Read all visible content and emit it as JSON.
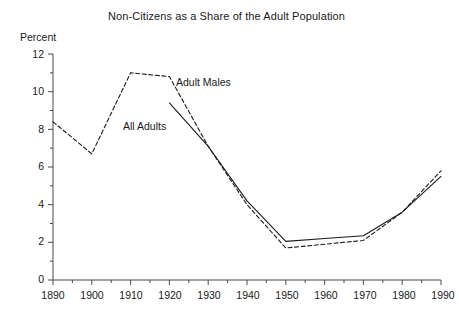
{
  "chart_data": {
    "type": "line",
    "title": "Non-Citizens as a Share of the Adult Population",
    "ylabel": "Percent",
    "xlabel": "",
    "xlim": [
      1890,
      1990
    ],
    "ylim": [
      0,
      12
    ],
    "grid": false,
    "legend_position": "inline-annotation",
    "x": [
      1890,
      1900,
      1910,
      1920,
      1930,
      1940,
      1950,
      1960,
      1970,
      1980,
      1990
    ],
    "xticks": [
      "1890",
      "1900",
      "1910",
      "1920",
      "1930",
      "1940",
      "1950",
      "1960",
      "1970",
      "1980",
      "1990"
    ],
    "yticks": [
      "0",
      "2",
      "4",
      "6",
      "8",
      "10",
      "12"
    ],
    "ytick_values": [
      0,
      2,
      4,
      6,
      8,
      10,
      12
    ],
    "minor_ytick_values": [
      1,
      3,
      5,
      7,
      9,
      11
    ],
    "series": [
      {
        "name": "Adult Males",
        "style": "dashed",
        "color": "#1a1a1a",
        "x": [
          1890,
          1900,
          1910,
          1920,
          1930,
          1940,
          1950,
          1960,
          1970,
          1980,
          1990
        ],
        "values": [
          8.4,
          6.7,
          11.0,
          10.8,
          7.1,
          4.0,
          1.7,
          1.9,
          2.1,
          3.6,
          5.8
        ]
      },
      {
        "name": "All Adults",
        "style": "solid",
        "color": "#1a1a1a",
        "x": [
          1920,
          1930,
          1940,
          1950,
          1960,
          1970,
          1980,
          1990
        ],
        "values": [
          9.4,
          7.1,
          4.2,
          2.05,
          2.2,
          2.35,
          3.6,
          5.5
        ]
      }
    ],
    "annotations": [
      {
        "text": "Adult Males",
        "x_px": 176,
        "y_px": 76
      },
      {
        "text": "All Adults",
        "x_px": 123,
        "y_px": 120
      }
    ]
  }
}
